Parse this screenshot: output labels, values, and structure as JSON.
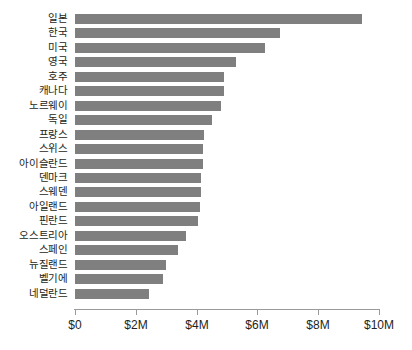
{
  "chart_data": {
    "type": "bar",
    "orientation": "horizontal",
    "title": "",
    "subtitle": "",
    "xlabel": "",
    "ylabel": "",
    "grid": false,
    "legend": false,
    "legend_position": "none",
    "bar_color": "#7f7f7f",
    "axis_color": "#9a9a9a",
    "text_color": "#231f20",
    "xlim": [
      0,
      10000000
    ],
    "xtick_values": [
      0,
      2000000,
      4000000,
      6000000,
      8000000,
      10000000
    ],
    "xtick_labels": [
      "$0",
      "$2M",
      "$4M",
      "$6M",
      "$8M",
      "$10M"
    ],
    "value_unit": "USD",
    "categories": [
      "일본",
      "한국",
      "미국",
      "영국",
      "호주",
      "캐나다",
      "노르웨이",
      "독일",
      "프랑스",
      "스위스",
      "아이슬란드",
      "덴마크",
      "스웨덴",
      "아일랜드",
      "핀란드",
      "오스트리아",
      "스페인",
      "뉴질랜드",
      "벨기에",
      "네덜란드"
    ],
    "values": [
      9450000,
      6750000,
      6250000,
      5300000,
      4900000,
      4900000,
      4800000,
      4500000,
      4250000,
      4200000,
      4200000,
      4150000,
      4150000,
      4100000,
      4050000,
      3650000,
      3400000,
      3000000,
      2900000,
      2450000
    ],
    "series": [
      {
        "name": "",
        "values": [
          9450000,
          6750000,
          6250000,
          5300000,
          4900000,
          4900000,
          4800000,
          4500000,
          4250000,
          4200000,
          4200000,
          4150000,
          4150000,
          4100000,
          4050000,
          3650000,
          3400000,
          3000000,
          2900000,
          2450000
        ]
      }
    ]
  }
}
